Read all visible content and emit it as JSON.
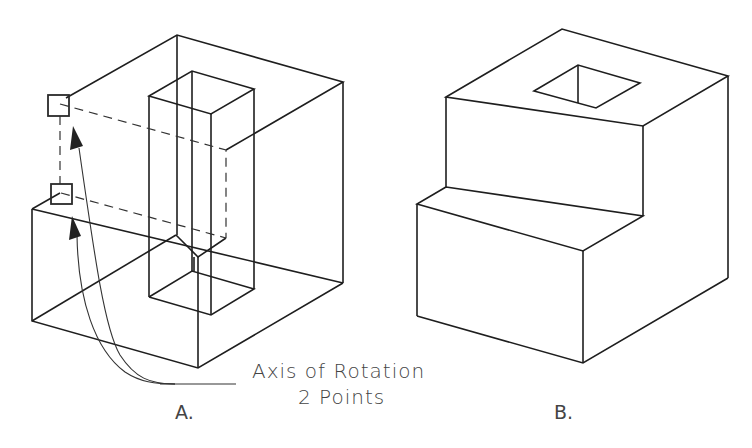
{
  "figure": {
    "views": [
      {
        "id": "A",
        "caption": "A.",
        "description": "Wireframe block with vertical rectangular column; two points selected defining axis of rotation"
      },
      {
        "id": "B",
        "caption": "B.",
        "description": "Stepped solid block with square hole on top"
      }
    ],
    "annotation": {
      "line1": "Axis of Rotation",
      "line2": "2 Points"
    },
    "colors": {
      "line": "#1e1e1e",
      "text": "#444444",
      "background": "#ffffff"
    }
  }
}
